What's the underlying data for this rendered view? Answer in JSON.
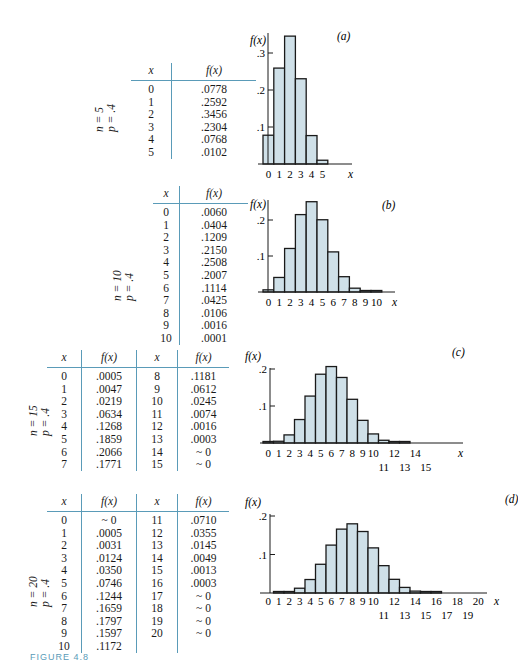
{
  "figure": {
    "caption": "FIGURE 4.8"
  },
  "panels": [
    {
      "label": "(a)",
      "params": {
        "n": "n = 5",
        "p": "p = .4"
      },
      "table": {
        "headers": [
          "x",
          "f(x)"
        ],
        "rows": [
          [
            "0",
            ".0778"
          ],
          [
            "1",
            ".2592"
          ],
          [
            "2",
            ".3456"
          ],
          [
            "3",
            ".2304"
          ],
          [
            "4",
            ".0768"
          ],
          [
            "5",
            ".0102"
          ]
        ]
      }
    },
    {
      "label": "(b)",
      "params": {
        "n": "n = 10",
        "p": "p = .4"
      },
      "table": {
        "headers": [
          "x",
          "f(x)"
        ],
        "rows": [
          [
            "0",
            ".0060"
          ],
          [
            "1",
            ".0404"
          ],
          [
            "2",
            ".1209"
          ],
          [
            "3",
            ".2150"
          ],
          [
            "4",
            ".2508"
          ],
          [
            "5",
            ".2007"
          ],
          [
            "6",
            ".1114"
          ],
          [
            "7",
            ".0425"
          ],
          [
            "8",
            ".0106"
          ],
          [
            "9",
            ".0016"
          ],
          [
            "10",
            ".0001"
          ]
        ]
      }
    },
    {
      "label": "(c)",
      "params": {
        "n": "n = 15",
        "p": "p = .4"
      },
      "table": {
        "headers": [
          "x",
          "f(x)",
          "x",
          "f(x)"
        ],
        "rows": [
          [
            "0",
            ".0005",
            "8",
            ".1181"
          ],
          [
            "1",
            ".0047",
            "9",
            ".0612"
          ],
          [
            "2",
            ".0219",
            "10",
            ".0245"
          ],
          [
            "3",
            ".0634",
            "11",
            ".0074"
          ],
          [
            "4",
            ".1268",
            "12",
            ".0016"
          ],
          [
            "5",
            ".1859",
            "13",
            ".0003"
          ],
          [
            "6",
            ".2066",
            "14",
            "~ 0"
          ],
          [
            "7",
            ".1771",
            "15",
            "~ 0"
          ]
        ]
      }
    },
    {
      "label": "(d)",
      "params": {
        "n": "n = 20",
        "p": "p = .4"
      },
      "table": {
        "headers": [
          "x",
          "f(x)",
          "x",
          "f(x)"
        ],
        "rows": [
          [
            "0",
            "~ 0",
            "11",
            ".0710"
          ],
          [
            "1",
            ".0005",
            "12",
            ".0355"
          ],
          [
            "2",
            ".0031",
            "13",
            ".0145"
          ],
          [
            "3",
            ".0124",
            "14",
            ".0049"
          ],
          [
            "4",
            ".0350",
            "15",
            ".0013"
          ],
          [
            "5",
            ".0746",
            "16",
            ".0003"
          ],
          [
            "6",
            ".1244",
            "17",
            "~ 0"
          ],
          [
            "7",
            ".1659",
            "18",
            "~ 0"
          ],
          [
            "8",
            ".1797",
            "19",
            "~ 0"
          ],
          [
            "9",
            ".1597",
            "20",
            "~ 0"
          ],
          [
            "10",
            ".1172",
            "",
            ""
          ]
        ]
      }
    }
  ],
  "colors": {
    "bar_fill": "#cfe0e8",
    "bar_stroke": "#1a1a1a",
    "table_rule": "#5a9bb8",
    "axis": "#1a1a1a"
  },
  "chart_data": [
    {
      "type": "bar",
      "title": "(a)",
      "xlabel": "x",
      "ylabel": "f(x)",
      "categories": [
        "0",
        "1",
        "2",
        "3",
        "4",
        "5"
      ],
      "x_tick_labels": [
        "0",
        "1",
        "2",
        "3",
        "4",
        "5"
      ],
      "values": [
        0.0778,
        0.2592,
        0.3456,
        0.2304,
        0.0768,
        0.0102
      ],
      "y_ticks": [
        ".1",
        ".2",
        ".3"
      ],
      "ylim": [
        0,
        0.35
      ],
      "grid": false,
      "layout": {
        "axis_x": 268,
        "bar_x0": 263,
        "bar_w": 10.8,
        "base_y": 164,
        "unit_px": 370,
        "axis_top": 33,
        "axis_right": 352,
        "xlabel_x": 348,
        "label_x": 337,
        "label_y": 40,
        "ylabel_x": 250,
        "ylabel_y": 44,
        "tick_label_y": 178
      }
    },
    {
      "type": "bar",
      "title": "(b)",
      "xlabel": "x",
      "ylabel": "f(x)",
      "categories": [
        "0",
        "1",
        "2",
        "3",
        "4",
        "5",
        "6",
        "7",
        "8",
        "9",
        "10"
      ],
      "x_tick_labels": [
        "0",
        "1",
        "2",
        "3",
        "4",
        "5",
        "6",
        "7",
        "8",
        "9",
        "10"
      ],
      "values": [
        0.006,
        0.0404,
        0.1209,
        0.215,
        0.2508,
        0.2007,
        0.1114,
        0.0425,
        0.0106,
        0.0016,
        0.0001
      ],
      "y_ticks": [
        ".1",
        ".2"
      ],
      "ylim": [
        0,
        0.25
      ],
      "grid": false,
      "layout": {
        "axis_x": 268,
        "bar_x0": 263,
        "bar_w": 10.8,
        "base_y": 292,
        "unit_px": 360,
        "axis_top": 200,
        "axis_right": 395,
        "xlabel_x": 392,
        "label_x": 382,
        "label_y": 209,
        "ylabel_x": 250,
        "ylabel_y": 208,
        "tick_label_y": 306
      }
    },
    {
      "type": "bar",
      "title": "(c)",
      "xlabel": "x",
      "ylabel": "f(x)",
      "categories": [
        "0",
        "1",
        "2",
        "3",
        "4",
        "5",
        "6",
        "7",
        "8",
        "9",
        "10",
        "11",
        "12",
        "13",
        "14",
        "15"
      ],
      "x_tick_labels": [
        "0",
        "1",
        "2",
        "3",
        "4",
        "5",
        "6",
        "7",
        "8",
        "9",
        "10",
        "11",
        "12",
        "13",
        "14",
        "15"
      ],
      "values": [
        0.0005,
        0.0047,
        0.0219,
        0.0634,
        0.1268,
        0.1859,
        0.2066,
        0.1771,
        0.1181,
        0.0612,
        0.0245,
        0.0074,
        0.0016,
        0.0003,
        0,
        0
      ],
      "y_ticks": [
        ".1",
        ".2"
      ],
      "ylim": [
        0,
        0.2
      ],
      "grid": false,
      "layout": {
        "axis_x": 270,
        "bar_x0": 263,
        "bar_w": 10.5,
        "base_y": 443,
        "unit_px": 370,
        "axis_top": 368,
        "axis_right": 463,
        "xlabel_x": 458,
        "label_x": 452,
        "label_y": 356,
        "ylabel_x": 245,
        "ylabel_y": 360,
        "tick_label_y": 457
      }
    },
    {
      "type": "bar",
      "title": "(d)",
      "xlabel": "x",
      "ylabel": "f(x)",
      "categories": [
        "0",
        "1",
        "2",
        "3",
        "4",
        "5",
        "6",
        "7",
        "8",
        "9",
        "10",
        "11",
        "12",
        "13",
        "14",
        "15",
        "16",
        "17",
        "18",
        "19",
        "20"
      ],
      "x_tick_labels": [
        "0",
        "1",
        "2",
        "3",
        "4",
        "5",
        "6",
        "7",
        "8",
        "9",
        "10",
        "11",
        "12",
        "13",
        "14",
        "15",
        "16",
        "17",
        "18",
        "19",
        "20"
      ],
      "values": [
        0,
        0.0005,
        0.0031,
        0.0124,
        0.035,
        0.0746,
        0.1244,
        0.1659,
        0.1797,
        0.1597,
        0.1172,
        0.071,
        0.0355,
        0.0145,
        0.0049,
        0.0013,
        0.0003,
        0,
        0,
        0,
        0
      ],
      "y_ticks": [
        ".1",
        ".2"
      ],
      "ylim": [
        0,
        0.2
      ],
      "grid": false,
      "layout": {
        "axis_x": 270,
        "bar_x0": 263,
        "bar_w": 10.5,
        "base_y": 593,
        "unit_px": 385,
        "axis_top": 514,
        "axis_right": 487,
        "xlabel_x": 494,
        "label_x": 505,
        "label_y": 503,
        "ylabel_x": 245,
        "ylabel_y": 506,
        "tick_label_y": 605
      }
    }
  ]
}
